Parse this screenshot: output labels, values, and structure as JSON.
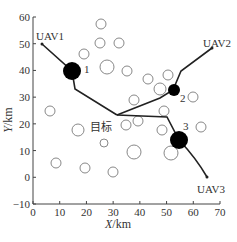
{
  "chart_data": {
    "type": "scatter",
    "title": "",
    "xlabel": "X/km",
    "ylabel": "Y/km",
    "xlim": [
      0,
      70
    ],
    "ylim": [
      -10,
      60
    ],
    "xticks": [
      "0",
      "10",
      "20",
      "30",
      "40",
      "50",
      "60",
      "70"
    ],
    "yticks": [
      "-10",
      "0",
      "10",
      "20",
      "30",
      "40",
      "50",
      "60"
    ],
    "grid": false,
    "uavs": [
      {
        "name": "UAV1",
        "start": [
          3,
          50
        ]
      },
      {
        "name": "UAV2",
        "start": [
          67,
          49
        ]
      },
      {
        "name": "UAV3",
        "start": [
          65,
          0
        ]
      }
    ],
    "target": {
      "label": "目标",
      "position": [
        32,
        23
      ]
    },
    "threats": [
      {
        "label": "1",
        "center": [
          15,
          40
        ],
        "radius": 3
      },
      {
        "label": "2",
        "center": [
          53,
          33
        ],
        "radius": 2
      },
      {
        "label": "3",
        "center": [
          54,
          14
        ],
        "radius": 3
      }
    ],
    "obstacles_hollow_circles": [
      [
        25,
        49
      ],
      [
        25,
        43
      ],
      [
        32,
        41
      ],
      [
        19,
        35
      ],
      [
        27,
        30
      ],
      [
        35,
        30
      ],
      [
        41,
        37
      ],
      [
        47,
        42
      ],
      [
        55,
        40
      ],
      [
        60,
        30
      ],
      [
        44,
        25
      ],
      [
        38,
        22
      ],
      [
        50,
        19
      ],
      [
        54,
        26
      ],
      [
        6,
        25
      ],
      [
        17,
        18
      ],
      [
        27,
        14
      ],
      [
        37,
        10
      ],
      [
        9,
        6
      ],
      [
        20,
        4
      ],
      [
        30,
        2
      ],
      [
        40,
        14
      ],
      [
        48,
        10
      ],
      [
        52,
        10
      ],
      [
        43,
        18
      ],
      [
        62,
        20
      ]
    ]
  },
  "axes": {
    "x_title": "X/km",
    "y_title": "Y/km"
  }
}
